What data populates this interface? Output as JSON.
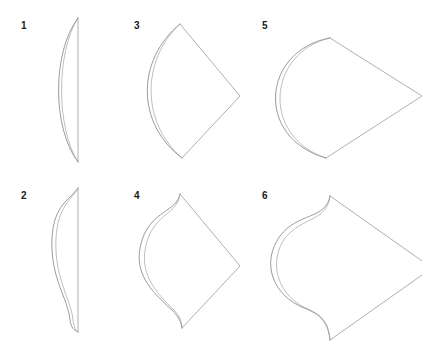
{
  "page": {
    "kind": "hand-drawn geometry sketch sheet",
    "background_color": "#ffffff",
    "ink_color": "#8f8f96",
    "label_color": "#1b1b1b",
    "width": 422,
    "height": 340,
    "layout": "3 columns x 2 rows of numbered line drawings"
  },
  "figures": [
    {
      "number": "1",
      "name": "lens-crescent",
      "description": "Narrow crescent: straight vertical chord on the right, single circular-arc bulging left, drawn with a doubled hand-sketched outline.",
      "arc_depth": "shallow",
      "has_ogee_hooks": false,
      "right_side": "straight vertical chord",
      "ink": "#8f8f96",
      "paths": {
        "chord": "M 70 10 L 70 154",
        "arc_outer": "M 70 10 C 44 44 44 120 70 154",
        "arc_inner": "M 70 10 C 48 44 48 120 70 154"
      }
    },
    {
      "number": "2",
      "name": "ogee-crescent",
      "description": "Same crescent as figure 1 but the left curve reverses into S-curve (ogee) hooks at the top and bottom tips.",
      "arc_depth": "shallow",
      "has_ogee_hooks": true,
      "right_side": "straight vertical chord",
      "ink": "#8f8f96",
      "paths": {
        "chord": "M 70 10 L 70 154",
        "arc_outer": "M 70 10 C 62 22 46 26 44 60 C 42 100 60 120 62 142 C 63 150 66 152 70 154",
        "arc_inner": "M 70 10 C 63 23 50 28 48 60 C 46 100 63 121 65 142 C 66 150 68 153 70 154"
      }
    },
    {
      "number": "3",
      "name": "kite-shallow-arc",
      "description": "Kite / shield outline: shallow arc bulging to the left joins two straight edges that meet at a sharp point on the right.",
      "arc_depth": "shallow",
      "has_ogee_hooks": false,
      "right_side": "two straight edges meeting at a right-hand vertex",
      "ink": "#8f8f96",
      "paths": {
        "edges": "M 52 16 L 112 88 L 54 150",
        "arc_outer": "M 52 16 C 8 52 8 116 54 150",
        "arc_inner": "M 52 16 C 13 52 13 115 54 150"
      }
    },
    {
      "number": "4",
      "name": "kite-ogee-arc",
      "description": "Same kite as figure 3 but the left curve has S-curve (ogee) hooks at the top and bottom vertices, giving a bulbous lobe with spiked tips.",
      "arc_depth": "shallow",
      "has_ogee_hooks": true,
      "right_side": "two straight edges meeting at a right-hand vertex",
      "ink": "#8f8f96",
      "paths": {
        "edges": "M 52 16 L 112 88 L 54 150",
        "arc_outer": "M 52 16 C 49 34 24 32 14 62 C 4 94 22 112 44 132 C 51 139 53 144 54 150",
        "arc_inner": "M 52 16 C 50 36 28 35 19 63 C 10 94 26 113 47 133 C 53 140 54 145 54 150"
      }
    },
    {
      "number": "5",
      "name": "kite-deep-arc",
      "description": "Kite outline with a much deeper, nearly semicircular arc bulging far to the left; two straight edges meet at a point on the right.",
      "arc_depth": "deep",
      "has_ogee_hooks": false,
      "right_side": "two straight edges meeting at a right-hand vertex",
      "ink": "#8f8f96",
      "paths": {
        "edges": "M 74 30 L 166 88 L 70 150",
        "arc_outer": "M 74 30 C 6 42 -2 130 70 150",
        "arc_inner": "M 74 30 C 12 44 4 128 70 150"
      }
    },
    {
      "number": "6",
      "name": "kite-deep-ogee-arc",
      "description": "Deep rounded lobe like figure 5 but with S-curve (ogee) hooks at the top and bottom, producing upward and downward spikes where the lobe meets the straight edges.",
      "arc_depth": "deep",
      "has_ogee_hooks": true,
      "right_side": "two straight edges meeting at a right-hand vertex",
      "ink": "#8f8f96",
      "paths": {
        "edges": "M 74 18 L 176 90 L 74 162",
        "arc_outer": "M 74 18 C 70 42 42 34 24 58 C 4 86 18 118 48 130 C 66 137 72 145 74 162",
        "arc_inner": "M 74 18 C 71 44 47 38 29 60 C 11 86 23 119 52 131 C 68 138 73 147 74 162"
      }
    }
  ]
}
